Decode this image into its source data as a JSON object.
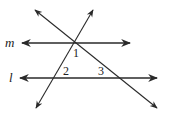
{
  "diagram": {
    "colors": {
      "line": "#2a2a2a",
      "background": "#ffffff"
    },
    "lines": {
      "m": {
        "label": "m",
        "y": 43,
        "x1": 22,
        "x2": 130
      },
      "l": {
        "label": "l",
        "y": 78,
        "x1": 20,
        "x2": 157
      }
    },
    "transversals": [
      {
        "name": "descending",
        "x1": 35,
        "y1": 10,
        "x2": 157,
        "y2": 108
      },
      {
        "name": "ascending",
        "x1": 93,
        "y1": 10,
        "x2": 36,
        "y2": 108
      }
    ],
    "angles": [
      {
        "label": "1",
        "x": 73,
        "y": 57
      },
      {
        "label": "2",
        "x": 63,
        "y": 75
      },
      {
        "label": "3",
        "x": 98,
        "y": 75
      }
    ]
  }
}
